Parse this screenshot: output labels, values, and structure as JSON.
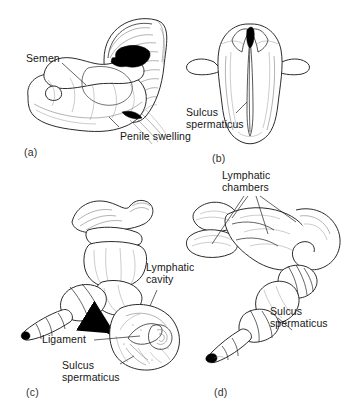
{
  "figure": {
    "background_color": "#ffffff",
    "ink_color": "#1a1a1a"
  },
  "panels": [
    {
      "letter": "(a)",
      "name": "everted-hemipenis-with-semen",
      "labels": [
        {
          "text": "Semen",
          "name": "label-semen"
        },
        {
          "text": "Penile swelling",
          "name": "label-penile-swelling"
        }
      ]
    },
    {
      "letter": "(b)",
      "name": "hemipenis-sulcate-face",
      "labels": [
        {
          "text": "Sulcus\nspermaticus",
          "name": "label-sulcus-spermaticus"
        }
      ]
    },
    {
      "letter": "(c)",
      "name": "hemipenis-with-cross-section-inset",
      "labels": [
        {
          "text": "Lymphatic\ncavity",
          "name": "label-lymphatic-cavity"
        },
        {
          "text": "Ligament",
          "name": "label-ligament"
        },
        {
          "text": "Sulcus\nspermaticus",
          "name": "label-sulcus-spermaticus-c"
        }
      ]
    },
    {
      "letter": "(d)",
      "name": "hemipenis-lymphatic-chambers",
      "labels": [
        {
          "text": "Lymphatic\nchambers",
          "name": "label-lymphatic-chambers"
        },
        {
          "text": "Sulcus\nspermaticus",
          "name": "label-sulcus-spermaticus-d"
        }
      ]
    }
  ]
}
